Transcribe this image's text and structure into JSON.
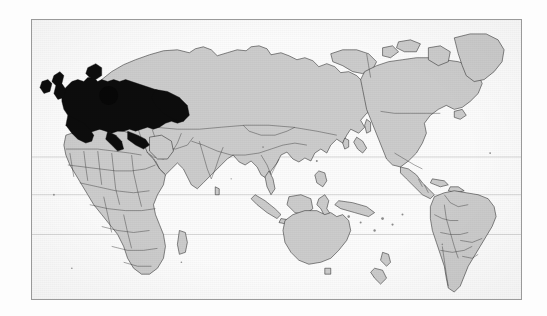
{
  "figure": {
    "kind": "world-map",
    "title": "World map with European region highlighted",
    "caption": "",
    "frame_border_color": "#9a9a9a",
    "background_color": "#fdfdfd",
    "ocean_color": "#fcfcfc"
  },
  "map": {
    "projection": "equirectangular",
    "land_fill_color": "#cccccc",
    "land_outline_color": "#2b2b2b",
    "highlight_fill_color": "#0d0d0d",
    "graticule_color": "#b9b9b9",
    "highlight_label": "Europe",
    "marker_label": "point-marker",
    "marker": {
      "cx": 108,
      "cy": 95,
      "r": 9.5
    },
    "latitude_lines": [
      {
        "name": "tropic-of-cancer",
        "y": 157
      },
      {
        "name": "equator",
        "y": 195
      },
      {
        "name": "tropic-of-capricorn",
        "y": 235
      }
    ],
    "regions": [
      {
        "name": "europe",
        "state": "highlighted"
      },
      {
        "name": "africa",
        "state": "normal"
      },
      {
        "name": "asia",
        "state": "normal"
      },
      {
        "name": "north-america",
        "state": "normal"
      },
      {
        "name": "south-america",
        "state": "normal"
      },
      {
        "name": "australia",
        "state": "normal"
      },
      {
        "name": "greenland",
        "state": "normal"
      },
      {
        "name": "new-zealand",
        "state": "normal"
      }
    ]
  },
  "legend": {
    "items": []
  },
  "labels": {
    "text_items": []
  }
}
